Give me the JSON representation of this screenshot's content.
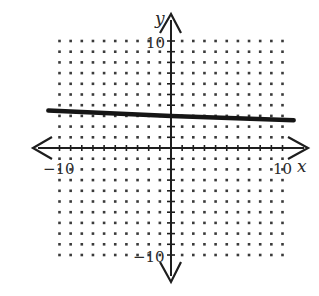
{
  "chart_data": {
    "type": "line",
    "title": "",
    "xlabel": "x",
    "ylabel": "y",
    "xlim": [
      -10,
      10
    ],
    "ylim": [
      -10,
      10
    ],
    "grid": "dotted",
    "grid_step": 1,
    "tick_labels": {
      "x": [
        "-10",
        "10"
      ],
      "y": [
        "10",
        "-10"
      ]
    },
    "series": [
      {
        "name": "line",
        "equation": "y = -0.04x + 3",
        "slope": -0.04,
        "intercept": 3,
        "x": [
          -11,
          0,
          11
        ],
        "y": [
          3.5,
          3,
          2.6
        ]
      }
    ]
  },
  "labels": {
    "x_axis": "x",
    "y_axis": "y",
    "x_min": "−10",
    "x_max": "10",
    "y_max": "10",
    "y_min": "−10"
  },
  "colors": {
    "ink": "#1e1e1e",
    "dots": "#3a3a3a",
    "background": "#ffffff"
  },
  "geometry": {
    "origin_px": [
      171,
      148
    ],
    "unit_px_x": 11.15,
    "unit_px_y": 10.7
  }
}
